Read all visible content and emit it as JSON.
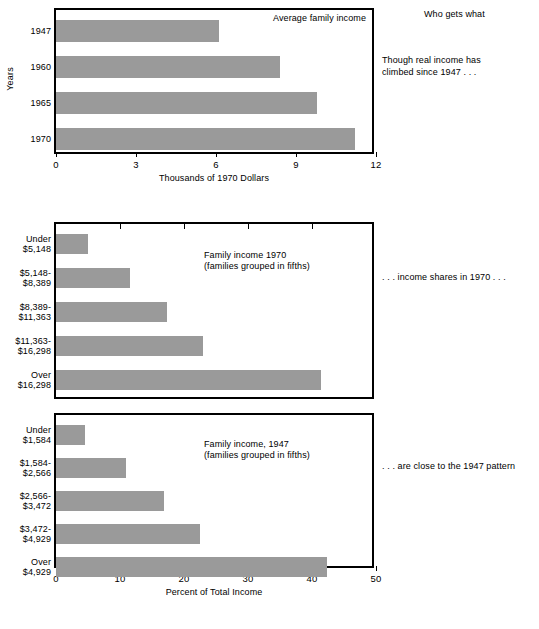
{
  "page": {
    "title": "Who gets what"
  },
  "annotations": {
    "note1": "Though real income has\nclimbed since 1947 . . .",
    "note2": ". . . income shares in 1970 . . .",
    "note3": ". . . are close to the 1947 pattern"
  },
  "charts": [
    {
      "id": "chart1",
      "caption": "Average family income",
      "ylabel": "Years",
      "xlabel": "Thousands of 1970 Dollars",
      "categories": [
        "1947",
        "1960",
        "1965",
        "1970"
      ],
      "values": [
        6.1,
        8.4,
        9.8,
        11.2
      ],
      "ticks": [
        "0",
        "3",
        "6",
        "9",
        "12"
      ]
    },
    {
      "id": "chart2",
      "caption": "Family income 1970\n(families grouped in fifths)",
      "ylabel": "",
      "xlabel": "",
      "categories": [
        "Under\n$5,148",
        "$5,148-\n$8,389",
        "$8,389-\n$11,363",
        "$11,363-\n$16,298",
        "Over\n$16,298"
      ],
      "values": [
        5.0,
        11.5,
        17.3,
        23.0,
        41.4
      ],
      "ticks": [
        "0",
        "10",
        "20",
        "30",
        "40",
        "50"
      ]
    },
    {
      "id": "chart3",
      "caption": "Family income, 1947\n(families grouped in fifths)",
      "ylabel": "",
      "xlabel": "Percent of Total Income",
      "categories": [
        "Under\n$1,584",
        "$1,584-\n$2,566",
        "$2,566-\n$3,472",
        "$3,472-\n$4,929",
        "Over\n$4,929"
      ],
      "values": [
        4.6,
        11.0,
        16.8,
        22.5,
        42.3
      ],
      "ticks": [
        "0",
        "10",
        "20",
        "30",
        "40",
        "50"
      ]
    }
  ],
  "chart_data": [
    {
      "type": "bar",
      "orientation": "horizontal",
      "title": "Average family income",
      "categories": [
        "1947",
        "1960",
        "1965",
        "1970"
      ],
      "values": [
        6.1,
        8.4,
        9.8,
        11.2
      ],
      "xlabel": "Thousands of 1970 Dollars",
      "ylabel": "Years",
      "xlim": [
        0,
        12
      ],
      "xticks": [
        0,
        3,
        6,
        9,
        12
      ],
      "grid": false,
      "legend": "none",
      "bar_color": "#9a9a9a"
    },
    {
      "type": "bar",
      "orientation": "horizontal",
      "title": "Family income 1970 (families grouped in fifths)",
      "categories": [
        "Under $5,148",
        "$5,148-$8,389",
        "$8,389-$11,363",
        "$11,363-$16,298",
        "Over $16,298"
      ],
      "values": [
        5.0,
        11.5,
        17.3,
        23.0,
        41.4
      ],
      "xlabel": "Percent of Total Income",
      "ylabel": "",
      "xlim": [
        0,
        50
      ],
      "xticks": [
        0,
        10,
        20,
        30,
        40,
        50
      ],
      "grid": false,
      "legend": "none",
      "bar_color": "#9a9a9a"
    },
    {
      "type": "bar",
      "orientation": "horizontal",
      "title": "Family income, 1947 (families grouped in fifths)",
      "categories": [
        "Under $1,584",
        "$1,584-$2,566",
        "$2,566-$3,472",
        "$3,472-$4,929",
        "Over $4,929"
      ],
      "values": [
        4.6,
        11.0,
        16.8,
        22.5,
        42.3
      ],
      "xlabel": "Percent of Total Income",
      "ylabel": "",
      "xlim": [
        0,
        50
      ],
      "xticks": [
        0,
        10,
        20,
        30,
        40,
        50
      ],
      "grid": false,
      "legend": "none",
      "bar_color": "#9a9a9a"
    }
  ]
}
